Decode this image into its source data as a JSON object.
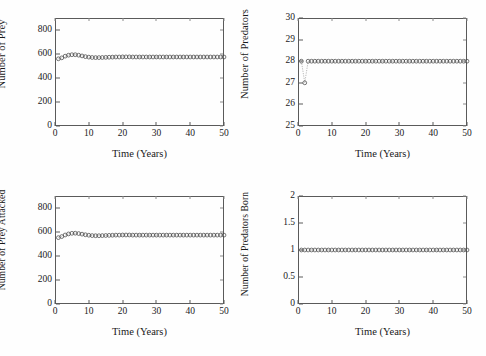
{
  "figure": {
    "background": "#fefefe",
    "axis_color": "#5a5a5a",
    "marker_color": "#4a4a4a",
    "line_color": "#9a9a9a",
    "marker": "open-circle",
    "rows": 2,
    "cols": 2
  },
  "panels": [
    {
      "id": "prey",
      "ylabel": "Number of Prey",
      "xlabel": "Time (Years)",
      "yticks": [
        "0",
        "200",
        "400",
        "600",
        "800"
      ],
      "xticks": [
        "0",
        "10",
        "20",
        "30",
        "40",
        "50"
      ]
    },
    {
      "id": "predators",
      "ylabel": "Number of Predators",
      "xlabel": "Time (Years)",
      "yticks": [
        "25",
        "26",
        "27",
        "28",
        "29",
        "30"
      ],
      "xticks": [
        "0",
        "10",
        "20",
        "30",
        "40",
        "50"
      ]
    },
    {
      "id": "prey-attacked",
      "ylabel": "Number of Prey Attacked",
      "xlabel": "Time (Years)",
      "yticks": [
        "0",
        "200",
        "400",
        "600",
        "800"
      ],
      "xticks": [
        "0",
        "10",
        "20",
        "30",
        "40",
        "50"
      ]
    },
    {
      "id": "predators-born",
      "ylabel": "Number of Predators Born",
      "xlabel": "Time (Years)",
      "yticks": [
        "0",
        "0.5",
        "1",
        "1.5",
        "2"
      ],
      "xticks": [
        "0",
        "10",
        "20",
        "30",
        "40",
        "50"
      ]
    }
  ],
  "chart_data": [
    {
      "type": "line",
      "id": "prey",
      "title": "",
      "xlabel": "Time (Years)",
      "ylabel": "Number of Prey",
      "xlim": [
        0,
        50
      ],
      "ylim": [
        0,
        900
      ],
      "yticks": [
        0,
        200,
        400,
        600,
        800
      ],
      "xticks": [
        0,
        10,
        20,
        30,
        40,
        50
      ],
      "grid": false,
      "legend": "none",
      "marker": "open-circle",
      "x": [
        1,
        2,
        3,
        4,
        5,
        6,
        7,
        8,
        9,
        10,
        11,
        12,
        13,
        14,
        15,
        16,
        17,
        18,
        19,
        20,
        21,
        22,
        23,
        24,
        25,
        26,
        27,
        28,
        29,
        30,
        31,
        32,
        33,
        34,
        35,
        36,
        37,
        38,
        39,
        40,
        41,
        42,
        43,
        44,
        45,
        46,
        47,
        48,
        49,
        50
      ],
      "y": [
        560,
        568,
        582,
        590,
        594,
        594,
        590,
        584,
        578,
        574,
        571,
        570,
        570,
        571,
        572,
        573,
        574,
        575,
        575,
        576,
        576,
        576,
        575,
        575,
        575,
        575,
        575,
        575,
        575,
        575,
        575,
        575,
        575,
        575,
        575,
        575,
        575,
        575,
        575,
        575,
        575,
        575,
        575,
        575,
        575,
        575,
        575,
        575,
        575,
        575
      ]
    },
    {
      "type": "line",
      "id": "predators",
      "title": "",
      "xlabel": "Time (Years)",
      "ylabel": "Number of Predators",
      "xlim": [
        0,
        50
      ],
      "ylim": [
        25,
        30
      ],
      "yticks": [
        25,
        26,
        27,
        28,
        29,
        30
      ],
      "xticks": [
        0,
        10,
        20,
        30,
        40,
        50
      ],
      "grid": false,
      "legend": "none",
      "marker": "open-circle",
      "x": [
        1,
        2,
        3,
        4,
        5,
        6,
        7,
        8,
        9,
        10,
        11,
        12,
        13,
        14,
        15,
        16,
        17,
        18,
        19,
        20,
        21,
        22,
        23,
        24,
        25,
        26,
        27,
        28,
        29,
        30,
        31,
        32,
        33,
        34,
        35,
        36,
        37,
        38,
        39,
        40,
        41,
        42,
        43,
        44,
        45,
        46,
        47,
        48,
        49,
        50
      ],
      "y": [
        28,
        27,
        28,
        28,
        28,
        28,
        28,
        28,
        28,
        28,
        28,
        28,
        28,
        28,
        28,
        28,
        28,
        28,
        28,
        28,
        28,
        28,
        28,
        28,
        28,
        28,
        28,
        28,
        28,
        28,
        28,
        28,
        28,
        28,
        28,
        28,
        28,
        28,
        28,
        28,
        28,
        28,
        28,
        28,
        28,
        28,
        28,
        28,
        28,
        28
      ]
    },
    {
      "type": "line",
      "id": "prey-attacked",
      "title": "",
      "xlabel": "Time (Years)",
      "ylabel": "Number of Prey Attacked",
      "xlim": [
        0,
        50
      ],
      "ylim": [
        0,
        900
      ],
      "yticks": [
        0,
        200,
        400,
        600,
        800
      ],
      "xticks": [
        0,
        10,
        20,
        30,
        40,
        50
      ],
      "grid": false,
      "legend": "none",
      "marker": "open-circle",
      "x": [
        1,
        2,
        3,
        4,
        5,
        6,
        7,
        8,
        9,
        10,
        11,
        12,
        13,
        14,
        15,
        16,
        17,
        18,
        19,
        20,
        21,
        22,
        23,
        24,
        25,
        26,
        27,
        28,
        29,
        30,
        31,
        32,
        33,
        34,
        35,
        36,
        37,
        38,
        39,
        40,
        41,
        42,
        43,
        44,
        45,
        46,
        47,
        48,
        49,
        50
      ],
      "y": [
        553,
        562,
        575,
        584,
        589,
        590,
        587,
        582,
        577,
        573,
        570,
        569,
        569,
        570,
        571,
        572,
        573,
        574,
        574,
        575,
        575,
        575,
        574,
        574,
        574,
        574,
        574,
        574,
        574,
        574,
        574,
        574,
        574,
        574,
        574,
        574,
        574,
        574,
        574,
        574,
        574,
        574,
        574,
        574,
        574,
        574,
        574,
        574,
        574,
        574
      ]
    },
    {
      "type": "line",
      "id": "predators-born",
      "title": "",
      "xlabel": "Time (Years)",
      "ylabel": "Number of Predators Born",
      "xlim": [
        0,
        50
      ],
      "ylim": [
        0,
        2
      ],
      "yticks": [
        0,
        0.5,
        1,
        1.5,
        2
      ],
      "xticks": [
        0,
        10,
        20,
        30,
        40,
        50
      ],
      "grid": false,
      "legend": "none",
      "marker": "open-circle",
      "x": [
        1,
        2,
        3,
        4,
        5,
        6,
        7,
        8,
        9,
        10,
        11,
        12,
        13,
        14,
        15,
        16,
        17,
        18,
        19,
        20,
        21,
        22,
        23,
        24,
        25,
        26,
        27,
        28,
        29,
        30,
        31,
        32,
        33,
        34,
        35,
        36,
        37,
        38,
        39,
        40,
        41,
        42,
        43,
        44,
        45,
        46,
        47,
        48,
        49,
        50
      ],
      "y": [
        1,
        1,
        1,
        1,
        1,
        1,
        1,
        1,
        1,
        1,
        1,
        1,
        1,
        1,
        1,
        1,
        1,
        1,
        1,
        1,
        1,
        1,
        1,
        1,
        1,
        1,
        1,
        1,
        1,
        1,
        1,
        1,
        1,
        1,
        1,
        1,
        1,
        1,
        1,
        1,
        1,
        1,
        1,
        1,
        1,
        1,
        1,
        1,
        1,
        1
      ]
    }
  ]
}
